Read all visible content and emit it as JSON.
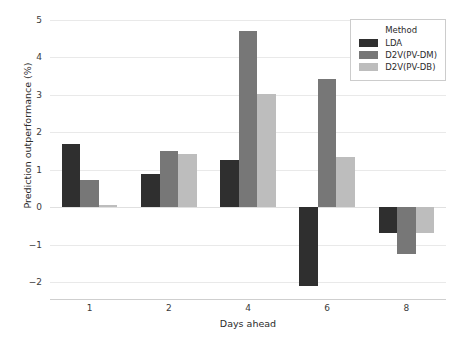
{
  "chart_data": {
    "type": "bar",
    "title": "",
    "xlabel": "Days ahead",
    "ylabel": "Prediction outperformance (%)",
    "categories": [
      "1",
      "2",
      "4",
      "6",
      "8"
    ],
    "series": [
      {
        "name": "LDA",
        "color": "#2f2f2f",
        "values": [
          1.68,
          0.89,
          1.27,
          -2.1,
          -0.7
        ]
      },
      {
        "name": "D2V(PV-DM)",
        "color": "#777777",
        "values": [
          0.72,
          1.5,
          4.7,
          3.42,
          -1.25
        ]
      },
      {
        "name": "D2V(PV-DB)",
        "color": "#bdbdbd",
        "values": [
          0.07,
          1.42,
          3.03,
          1.34,
          -0.7
        ]
      }
    ],
    "ylim": [
      -2.45,
      5.0
    ],
    "yticks": [
      5,
      4,
      3,
      2,
      1,
      0,
      -1,
      -2
    ],
    "ytick_labels": [
      "5",
      "4",
      "3",
      "2",
      "1",
      "0",
      "−1",
      "−2"
    ],
    "grid": true,
    "legend": {
      "title": "Method",
      "position": "upper right",
      "entries": [
        "LDA",
        "D2V(PV-DM)",
        "D2V(PV-DB)"
      ]
    }
  }
}
